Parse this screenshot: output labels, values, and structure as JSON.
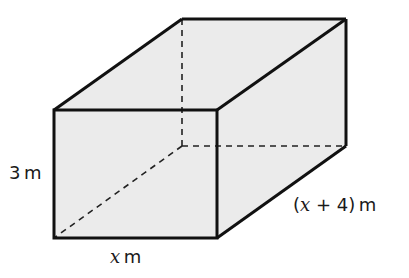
{
  "diagram": {
    "type": "rectangular-prism",
    "colors": {
      "fill": "#ebebeb",
      "edge": "#111111",
      "hidden_edge": "#222222",
      "background": "#ffffff"
    },
    "labels": {
      "height": {
        "value": "3",
        "unit": "m"
      },
      "width": {
        "variable": "x",
        "unit": "m"
      },
      "depth": {
        "open": "(",
        "variable": "x",
        "rest": " + 4)",
        "unit": "m"
      }
    }
  }
}
